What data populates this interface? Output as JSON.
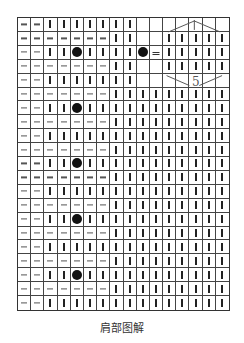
{
  "chart": {
    "columns": 16,
    "rows_count": 21,
    "legend": {
      "-": "dash (purl)",
      "|": "bar (knit)",
      "o": "dot (bobble/hole)",
      "=": "equals",
      " ": "empty"
    },
    "rows": [
      "--|||||||       ",
      "-------||  |||||",
      "--||o||||o=|||||",
      "-------||  |||||",
      "--|||||||       ",
      "-------|||||||||",
      "--||o|||||||||||",
      "-------|||||||||",
      "--||||||||||||||",
      "-------|||||||||",
      "--||o|||||||||||",
      "-------|||||||||",
      "--||||||||||||||",
      "-------|||||||||",
      "--||o|||||||||||",
      "-------|||||||||",
      "--||||||||||||||",
      "-------|||||||||",
      "--||o|||||||||||",
      "-------|||||||||",
      "--||||||||||||||"
    ],
    "annotation": {
      "label": "5",
      "span_columns": [
        11,
        16
      ],
      "span_rows": [
        1,
        5
      ]
    }
  },
  "caption": "肩部图解"
}
